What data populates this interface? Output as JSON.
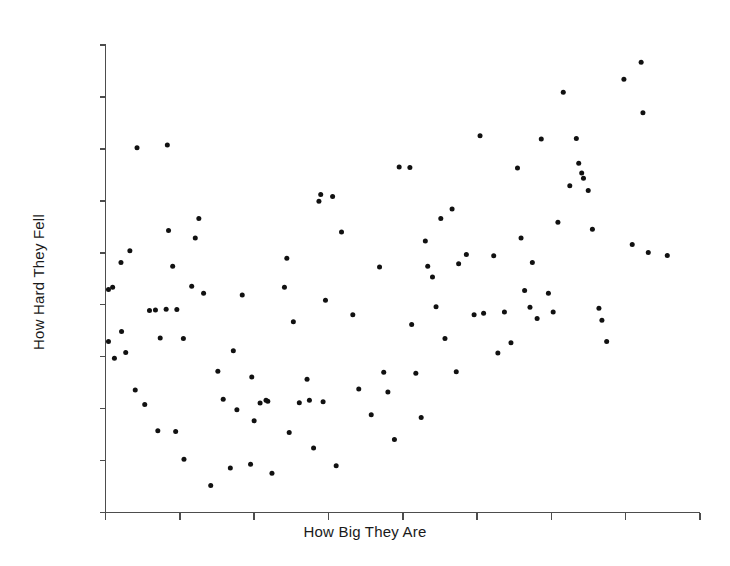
{
  "chart_data": {
    "type": "scatter",
    "title": "",
    "xlabel": "How Big They Are",
    "ylabel": "How Hard They Fell",
    "xlim": [
      0,
      100
    ],
    "ylim": [
      0,
      100
    ],
    "grid": false,
    "legend": null,
    "xtick_labels": [],
    "ytick_labels": [],
    "n_xticks": 9,
    "n_yticks": 10,
    "marker": "filled-circle",
    "marker_color": "#111111",
    "marker_size_px": 5,
    "axis_color": "#4d4d4d",
    "background_color": "#ffffff",
    "n_points": 110,
    "points": [
      [
        0.5,
        47.7
      ],
      [
        0.5,
        36.6
      ],
      [
        1.2,
        48.2
      ],
      [
        1.5,
        33.0
      ],
      [
        2.6,
        53.5
      ],
      [
        2.7,
        38.7
      ],
      [
        3.4,
        34.2
      ],
      [
        4.1,
        56.0
      ],
      [
        5.0,
        26.2
      ],
      [
        5.3,
        78.0
      ],
      [
        6.6,
        23.1
      ],
      [
        7.4,
        43.2
      ],
      [
        8.4,
        43.3
      ],
      [
        8.8,
        17.5
      ],
      [
        9.2,
        37.3
      ],
      [
        10.2,
        43.5
      ],
      [
        10.4,
        78.6
      ],
      [
        10.6,
        60.3
      ],
      [
        11.3,
        52.7
      ],
      [
        11.8,
        17.3
      ],
      [
        12.0,
        43.4
      ],
      [
        13.1,
        37.2
      ],
      [
        13.2,
        11.4
      ],
      [
        14.5,
        48.4
      ],
      [
        15.1,
        58.7
      ],
      [
        15.7,
        62.9
      ],
      [
        16.5,
        46.9
      ],
      [
        17.7,
        5.8
      ],
      [
        18.9,
        30.2
      ],
      [
        19.8,
        24.2
      ],
      [
        21.0,
        9.5
      ],
      [
        21.5,
        34.6
      ],
      [
        22.1,
        22.0
      ],
      [
        23.0,
        46.5
      ],
      [
        24.4,
        10.3
      ],
      [
        24.6,
        29.0
      ],
      [
        25.0,
        19.6
      ],
      [
        26.0,
        23.4
      ],
      [
        27.0,
        24.0
      ],
      [
        27.3,
        23.8
      ],
      [
        28.0,
        8.4
      ],
      [
        30.1,
        48.2
      ],
      [
        30.5,
        54.4
      ],
      [
        30.9,
        17.1
      ],
      [
        31.6,
        40.8
      ],
      [
        32.6,
        23.5
      ],
      [
        33.9,
        28.5
      ],
      [
        34.3,
        24.0
      ],
      [
        35.0,
        13.8
      ],
      [
        35.9,
        66.6
      ],
      [
        36.2,
        68.0
      ],
      [
        36.6,
        23.7
      ],
      [
        37.0,
        45.4
      ],
      [
        38.2,
        67.6
      ],
      [
        38.8,
        10.0
      ],
      [
        39.7,
        60.0
      ],
      [
        41.6,
        42.3
      ],
      [
        42.6,
        26.4
      ],
      [
        44.7,
        20.9
      ],
      [
        46.1,
        52.5
      ],
      [
        46.8,
        30.0
      ],
      [
        47.5,
        25.8
      ],
      [
        48.6,
        15.6
      ],
      [
        49.4,
        73.9
      ],
      [
        51.2,
        73.8
      ],
      [
        51.5,
        40.2
      ],
      [
        52.2,
        29.8
      ],
      [
        53.1,
        20.3
      ],
      [
        53.8,
        58.1
      ],
      [
        54.2,
        52.7
      ],
      [
        55.0,
        50.4
      ],
      [
        55.6,
        44.0
      ],
      [
        56.4,
        62.9
      ],
      [
        57.1,
        37.2
      ],
      [
        58.3,
        64.9
      ],
      [
        59.0,
        30.1
      ],
      [
        59.4,
        53.2
      ],
      [
        60.7,
        55.2
      ],
      [
        62.0,
        42.3
      ],
      [
        63.0,
        80.6
      ],
      [
        63.6,
        42.6
      ],
      [
        65.3,
        54.9
      ],
      [
        66.0,
        34.1
      ],
      [
        67.1,
        42.9
      ],
      [
        68.2,
        36.3
      ],
      [
        69.3,
        73.7
      ],
      [
        69.9,
        58.7
      ],
      [
        70.5,
        47.5
      ],
      [
        71.4,
        43.9
      ],
      [
        71.8,
        53.5
      ],
      [
        72.6,
        41.5
      ],
      [
        73.3,
        79.9
      ],
      [
        74.5,
        46.9
      ],
      [
        75.3,
        42.9
      ],
      [
        76.1,
        62.1
      ],
      [
        77.0,
        89.9
      ],
      [
        78.1,
        69.9
      ],
      [
        79.2,
        80.0
      ],
      [
        79.6,
        74.7
      ],
      [
        80.1,
        72.6
      ],
      [
        80.4,
        71.5
      ],
      [
        81.2,
        68.9
      ],
      [
        81.9,
        60.6
      ],
      [
        83.0,
        43.7
      ],
      [
        83.5,
        41.1
      ],
      [
        84.3,
        36.6
      ],
      [
        87.2,
        92.7
      ],
      [
        88.6,
        57.3
      ],
      [
        90.1,
        96.3
      ],
      [
        90.4,
        85.5
      ],
      [
        91.3,
        55.6
      ],
      [
        94.5,
        55.0
      ]
    ]
  },
  "axes": {
    "x_axis_name": "How Big They Are",
    "y_axis_name": "How Hard They Fell"
  }
}
